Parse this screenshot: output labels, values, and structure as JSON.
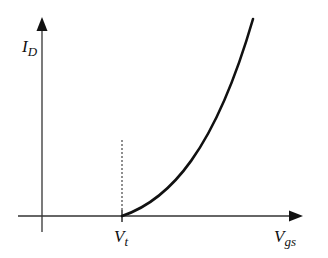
{
  "diagram": {
    "y_axis": {
      "label_main": "I",
      "label_sub": "D"
    },
    "x_axis": {
      "label_main": "V",
      "label_sub": "gs"
    },
    "threshold": {
      "label_main": "V",
      "label_sub": "t"
    },
    "curve": {
      "type": "square-law",
      "description": "drain current rises from zero at threshold voltage"
    },
    "colors": {
      "stroke": "#111111",
      "background": "#ffffff"
    }
  }
}
